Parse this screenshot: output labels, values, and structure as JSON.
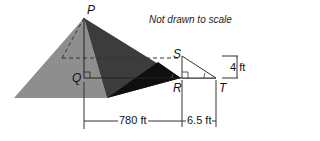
{
  "diagram": {
    "note": "Not drawn to scale",
    "points": {
      "P": "P",
      "Q": "Q",
      "R": "R",
      "S": "S",
      "T": "T"
    },
    "dimensions": {
      "QR": "780 ft",
      "RT": "6.5 ft",
      "ST": "4 ft"
    },
    "colors": {
      "left_face": "#8c8c8c",
      "front_face": "#3a3a3a",
      "right_face": "#0d0d0d",
      "lines": "#333333"
    }
  }
}
